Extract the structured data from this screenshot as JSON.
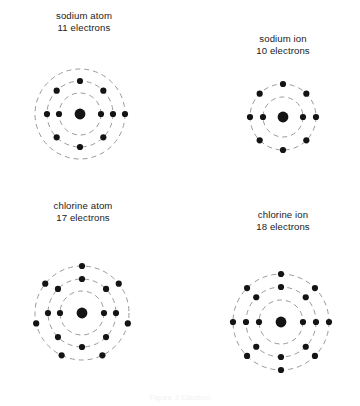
{
  "figure": {
    "title_visible": false,
    "background_color": "#ffffff",
    "orbit_color": "#9a9a9a",
    "electron_color": "#141414",
    "nucleus_color": "#141414",
    "caption": "Figure 2 Electron"
  },
  "diagrams": [
    {
      "id": "sodium-atom",
      "label_name": "sodium atom",
      "label_count": "11 electrons",
      "label_x": 42,
      "label_y": 10,
      "label_width": 84,
      "center_x": 80,
      "center_y": 114,
      "nucleus_radius": 5.4,
      "total_electrons": 11,
      "shells": [
        {
          "name": "shell-1",
          "radius": 21,
          "electrons": 2,
          "start_angle": 0
        },
        {
          "name": "shell-2",
          "radius": 33,
          "electrons": 8,
          "start_angle": -90
        },
        {
          "name": "shell-3",
          "radius": 45,
          "electrons": 1,
          "start_angle": 0
        }
      ]
    },
    {
      "id": "sodium-ion",
      "label_name": "sodium ion",
      "label_count": "10 electrons",
      "label_x": 241,
      "label_y": 33,
      "label_width": 84,
      "center_x": 283,
      "center_y": 117,
      "nucleus_radius": 5.4,
      "total_electrons": 10,
      "shells": [
        {
          "name": "shell-1",
          "radius": 20,
          "electrons": 2,
          "start_angle": 0
        },
        {
          "name": "shell-2",
          "radius": 33,
          "electrons": 8,
          "start_angle": -90
        }
      ]
    },
    {
      "id": "chlorine-atom",
      "label_name": "chlorine atom",
      "label_count": "17 electrons",
      "label_x": 38,
      "label_y": 200,
      "label_width": 90,
      "center_x": 82,
      "center_y": 313,
      "nucleus_radius": 5.4,
      "total_electrons": 17,
      "shells": [
        {
          "name": "shell-1",
          "radius": 22,
          "electrons": 2,
          "start_angle": 0
        },
        {
          "name": "shell-2",
          "radius": 34,
          "electrons": 8,
          "start_angle": -90
        },
        {
          "name": "shell-3",
          "radius": 47,
          "electrons": 7,
          "start_angle": -90
        }
      ]
    },
    {
      "id": "chlorine-ion",
      "label_name": "chlorine ion",
      "label_count": "18 electrons",
      "label_x": 239,
      "label_y": 209,
      "label_width": 88,
      "center_x": 281,
      "center_y": 322,
      "nucleus_radius": 5.4,
      "total_electrons": 18,
      "shells": [
        {
          "name": "shell-1",
          "radius": 22,
          "electrons": 2,
          "start_angle": 0
        },
        {
          "name": "shell-2",
          "radius": 35,
          "electrons": 8,
          "start_angle": -90
        },
        {
          "name": "shell-3",
          "radius": 48,
          "electrons": 8,
          "start_angle": -90
        }
      ]
    }
  ]
}
